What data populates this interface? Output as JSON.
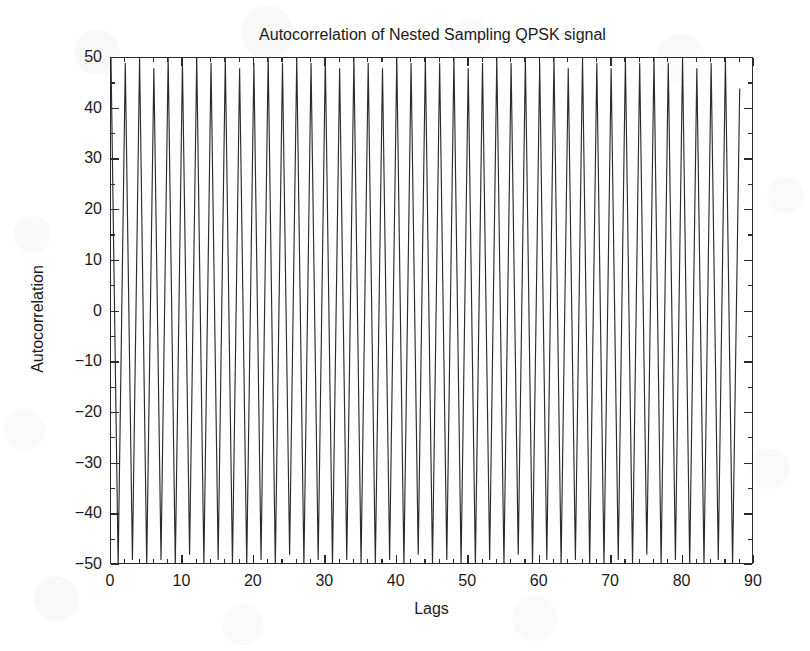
{
  "chart_data": {
    "type": "line",
    "title": "Autocorrelation of Nested Sampling QPSK signal",
    "xlabel": "Lags",
    "ylabel": "Autocorrelation",
    "xlim": [
      0,
      90
    ],
    "ylim": [
      -50,
      50
    ],
    "xticks": [
      0,
      10,
      20,
      30,
      40,
      50,
      60,
      70,
      80,
      90
    ],
    "yticks": [
      50,
      40,
      30,
      20,
      10,
      0,
      -10,
      -20,
      -30,
      -40,
      -50
    ],
    "grid": false,
    "legend": null,
    "legend_position": "none",
    "line_color": "#2b2b2b",
    "background_color": "#ffffff",
    "series": [
      {
        "name": "Autocorrelation",
        "comment": "x = lag index, y = autocorrelation value; alternating-sign envelope that fills the plot box top to bottom.",
        "x": [
          0,
          1,
          2,
          3,
          4,
          5,
          6,
          7,
          8,
          9,
          10,
          11,
          12,
          13,
          14,
          15,
          16,
          17,
          18,
          19,
          20,
          21,
          22,
          23,
          24,
          25,
          26,
          27,
          28,
          29,
          30,
          31,
          32,
          33,
          34,
          35,
          36,
          37,
          38,
          39,
          40,
          41,
          42,
          43,
          44,
          45,
          46,
          47,
          48,
          49,
          50,
          51,
          52,
          53,
          54,
          55,
          56,
          57,
          58,
          59,
          60,
          61,
          62,
          63,
          64,
          65,
          66,
          67,
          68,
          69,
          70,
          71,
          72,
          73,
          74,
          75,
          76,
          77,
          78,
          79,
          80,
          81,
          82,
          83,
          84,
          85,
          86,
          87,
          88
        ],
        "y": [
          50,
          -50,
          49,
          -49,
          50,
          -50,
          48,
          -49,
          50,
          -50,
          49,
          -48,
          50,
          -50,
          49,
          -49,
          50,
          -50,
          48,
          -50,
          49,
          -49,
          50,
          -50,
          49,
          -48,
          50,
          -50,
          49,
          -49,
          50,
          -50,
          48,
          -49,
          50,
          -50,
          49,
          -50,
          48,
          -49,
          50,
          -50,
          49,
          -48,
          50,
          -50,
          49,
          -49,
          50,
          -50,
          48,
          -50,
          49,
          -49,
          50,
          -50,
          49,
          -48,
          50,
          -50,
          49,
          -49,
          50,
          -50,
          48,
          -49,
          50,
          -50,
          49,
          -50,
          48,
          -49,
          50,
          -50,
          49,
          -48,
          50,
          -50,
          49,
          -49,
          50,
          -50,
          48,
          -50,
          49,
          -49,
          50,
          -50,
          44
        ]
      }
    ]
  },
  "axes": {
    "y_tick_labels": [
      "50",
      "40",
      "30",
      "20",
      "10",
      "0",
      "-10",
      "-20",
      "-30",
      "-40",
      "-50"
    ],
    "x_tick_labels": [
      "0",
      "10",
      "20",
      "30",
      "40",
      "50",
      "60",
      "70",
      "80",
      "90"
    ]
  }
}
